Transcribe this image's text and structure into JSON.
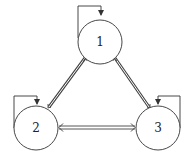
{
  "diagram": {
    "type": "state-transition-graph",
    "nodes": [
      {
        "id": "1",
        "label": "1",
        "cx": 100,
        "cy": 42,
        "r": 22
      },
      {
        "id": "2",
        "label": "2",
        "cx": 36,
        "cy": 128,
        "r": 22
      },
      {
        "id": "3",
        "label": "3",
        "cx": 158,
        "cy": 128,
        "r": 22
      }
    ],
    "edges": [
      {
        "from": "1",
        "to": "2",
        "style": "double-line",
        "bidirectional": true
      },
      {
        "from": "1",
        "to": "3",
        "style": "double-line",
        "bidirectional": true
      },
      {
        "from": "2",
        "to": "3",
        "style": "double-line",
        "bidirectional": true
      }
    ],
    "self_loops": [
      {
        "node": "1"
      },
      {
        "node": "2"
      },
      {
        "node": "3"
      }
    ],
    "colors": {
      "stroke": "#333333",
      "background": "#ffffff"
    }
  }
}
